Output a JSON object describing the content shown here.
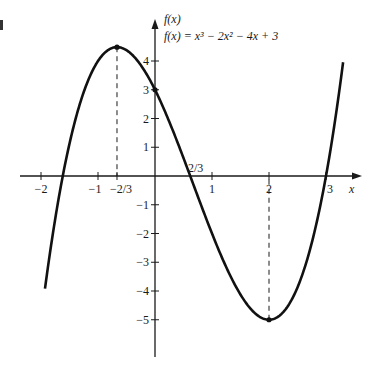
{
  "chart_data": {
    "type": "line",
    "title": "f(x) = x³ − 2x² − 4x + 3",
    "function": "x^3 - 2x^2 - 4x + 3",
    "xlabel": "x",
    "ylabel": "f(x)",
    "x_ticks": [
      {
        "value": -2,
        "label": "−2"
      },
      {
        "value": -1,
        "label": "−1"
      },
      {
        "value": -0.6667,
        "label": "−2/3"
      },
      {
        "value": 1,
        "label": "1"
      },
      {
        "value": 2,
        "label": "2"
      },
      {
        "value": 3,
        "label": "3"
      }
    ],
    "y_ticks": [
      {
        "value": 4,
        "label": "4"
      },
      {
        "value": 3,
        "label": "3"
      },
      {
        "value": 2,
        "label": "2"
      },
      {
        "value": 1,
        "label": "1"
      },
      {
        "value": -1,
        "label": "−1"
      },
      {
        "value": -2,
        "label": "−2"
      },
      {
        "value": -3,
        "label": "−3"
      },
      {
        "value": -4,
        "label": "−4"
      },
      {
        "value": -5,
        "label": "−5"
      }
    ],
    "xlim": [
      -2.4,
      3.9
    ],
    "ylim": [
      -6.3,
      5.5
    ],
    "x_range_plotted": [
      -1.93,
      3.3
    ],
    "annotations": [
      {
        "type": "point",
        "x": -0.6667,
        "y": 4.48,
        "note": "local maximum",
        "dashed_drop": true
      },
      {
        "type": "point",
        "x": 2,
        "y": -5,
        "note": "local minimum",
        "dashed_drop": true
      },
      {
        "type": "point",
        "x": 0,
        "y": 3,
        "note": "y-intercept"
      },
      {
        "type": "label",
        "x": 0.6667,
        "y": 0,
        "text": "2/3"
      }
    ],
    "grid": false,
    "legend": "none"
  },
  "labels": {
    "y_axis": "f(x)",
    "equation": "f(x) = x³ − 2x² − 4x + 3",
    "x_axis": "x",
    "root_label": "2/3"
  }
}
